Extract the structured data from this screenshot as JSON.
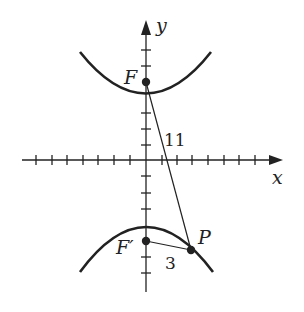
{
  "figure": {
    "type": "hyperbola-focal-diagram",
    "axes": {
      "x_label": "x",
      "y_label": "y",
      "x_ticks_each_side": 7,
      "y_ticks_above": 6,
      "y_ticks_below": 7
    },
    "points": {
      "focus_upper": {
        "label": "F"
      },
      "focus_lower": {
        "label": "F′"
      },
      "point_on_curve": {
        "label": "P"
      }
    },
    "segments": [
      {
        "from": "F",
        "to": "P",
        "length_label": "11"
      },
      {
        "from": "F′",
        "to": "P",
        "length_label": "3"
      }
    ],
    "colors": {
      "ink": "#222222",
      "background": "#ffffff"
    }
  }
}
